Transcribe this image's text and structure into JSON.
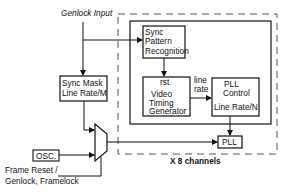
{
  "diagram": {
    "inputs": {
      "genlock_input": "Genlock Input",
      "frame_reset_line1": "Frame Reset /",
      "frame_reset_line2": "Genlock, Framelock"
    },
    "blocks": {
      "sync_pattern": {
        "line1": "Sync",
        "line2": "Pattern",
        "line3": "Recognition"
      },
      "sync_mask": {
        "line1": "Sync Mask",
        "line2": "Line Rate/M"
      },
      "video_timing": {
        "rst": "rst",
        "line1": "Video",
        "line2": "Timing",
        "line3": "Generator"
      },
      "pll_control": {
        "line1": "PLL",
        "line2": "Control",
        "line3": "Line Rate/N"
      },
      "osc": "OSC.",
      "pll": "PLL"
    },
    "signals": {
      "line_rate_line1": "line",
      "line_rate_line2": "rate"
    },
    "channel_group_label": "X 8 channels",
    "colors": {
      "stroke": "#111111",
      "background": "#ffffff",
      "dashed": "#555555"
    }
  }
}
